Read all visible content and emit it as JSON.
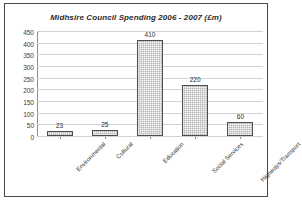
{
  "chart_data": {
    "type": "bar",
    "title": "Midhsire Council Spending  2006 - 2007  (£m)",
    "xlabel": "",
    "ylabel": "",
    "ylim": [
      0,
      450
    ],
    "ytick_step": 50,
    "grid": true,
    "legend": "none",
    "categories": [
      "Environmental",
      "Cultural",
      "Education",
      "Social Services",
      "Highways/Transport"
    ],
    "values": [
      23,
      25,
      410,
      220,
      60
    ],
    "value_labels": [
      "23",
      "25",
      "410",
      "220",
      "60"
    ],
    "ytick_labels": [
      "0",
      "50",
      "100",
      "150",
      "200",
      "250",
      "300",
      "350",
      "400",
      "450"
    ],
    "bar_fill_color": "#b3b3b3",
    "bar_border_color": "#4d4d4d",
    "gridline_color": "#d2d2d2",
    "axis_color": "#8d8d8d",
    "frame_color": "#4a4a4a",
    "background_color": "#ffffff"
  }
}
